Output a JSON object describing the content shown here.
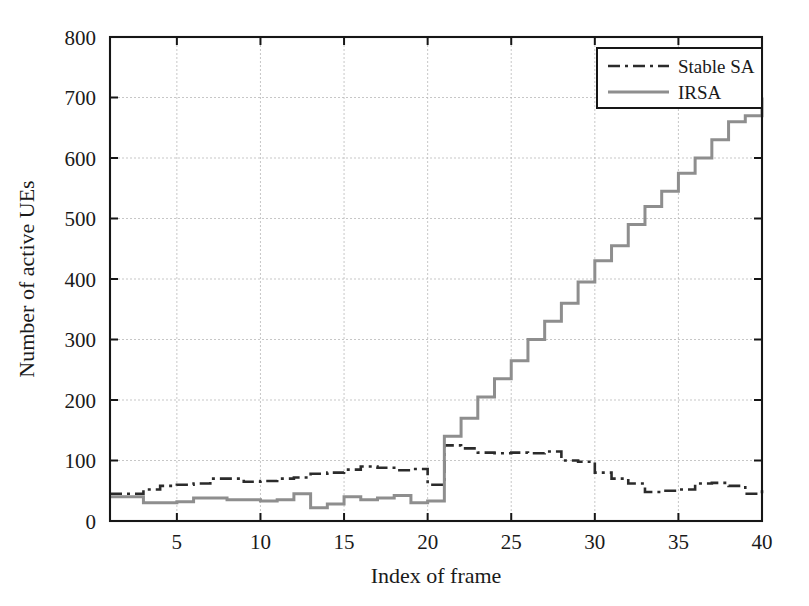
{
  "chart_data": {
    "type": "line",
    "title": "",
    "xlabel": "Index of frame",
    "ylabel": "Number of active UEs",
    "xlim": [
      1,
      40
    ],
    "ylim": [
      0,
      800
    ],
    "grid": true,
    "legend_position": "top-right",
    "drawstyle": "steps-post",
    "xticks": [
      5,
      10,
      15,
      20,
      25,
      30,
      35,
      40
    ],
    "xtick_labels": [
      "5",
      "10",
      "15",
      "20",
      "25",
      "30",
      "35",
      "40"
    ],
    "yticks": [
      0,
      100,
      200,
      300,
      400,
      500,
      600,
      700,
      800
    ],
    "ytick_labels": [
      "0",
      "100",
      "200",
      "300",
      "400",
      "500",
      "600",
      "700",
      "800"
    ],
    "x": [
      1,
      2,
      3,
      4,
      5,
      6,
      7,
      8,
      9,
      10,
      11,
      12,
      13,
      14,
      15,
      16,
      17,
      18,
      19,
      20,
      21,
      22,
      23,
      24,
      25,
      26,
      27,
      28,
      29,
      30,
      31,
      32,
      33,
      34,
      35,
      36,
      37,
      38,
      39,
      40
    ],
    "series": [
      {
        "name": "Stable SA",
        "color": "#2b2b2b",
        "linestyle": "dash-dot",
        "linewidth": 2.6,
        "values": [
          45,
          45,
          52,
          58,
          60,
          62,
          70,
          70,
          65,
          66,
          70,
          72,
          78,
          80,
          85,
          90,
          88,
          84,
          86,
          60,
          125,
          120,
          113,
          112,
          113,
          112,
          115,
          100,
          98,
          80,
          70,
          62,
          48,
          50,
          52,
          62,
          63,
          58,
          45,
          52
        ]
      },
      {
        "name": "IRSA",
        "color": "#8e8e8e",
        "linestyle": "solid",
        "linewidth": 3.0,
        "values": [
          40,
          40,
          30,
          30,
          32,
          38,
          38,
          35,
          35,
          33,
          35,
          45,
          22,
          28,
          40,
          35,
          38,
          42,
          30,
          33,
          140,
          170,
          205,
          235,
          265,
          300,
          330,
          360,
          395,
          430,
          455,
          490,
          520,
          545,
          575,
          600,
          630,
          660,
          670,
          700
        ]
      }
    ]
  },
  "legend": {
    "entries": [
      {
        "label": "Stable SA"
      },
      {
        "label": "IRSA"
      }
    ]
  }
}
